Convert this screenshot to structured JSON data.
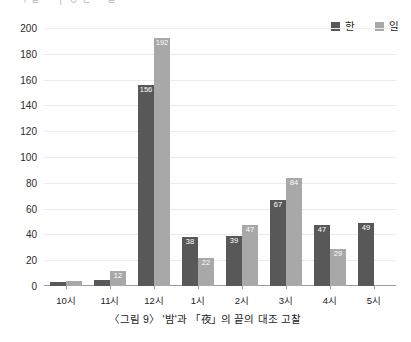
{
  "top_cropped_text": "ㄱ  ㄹ ㅡ ㅣ  ㅇ  ㄴ  ㅡ  ㄹ",
  "legend": {
    "position": "top-right",
    "entries": [
      {
        "label": "한",
        "color": "#585858",
        "icon": "legend-swatch"
      },
      {
        "label": "일",
        "color": "#a8a8a8",
        "icon": "legend-swatch"
      }
    ]
  },
  "caption": "〈그림 9〉 '밤'과 「夜」의 끝의 대조 고찰",
  "chart_data": {
    "type": "bar",
    "title": "",
    "subtitle": "",
    "xlabel": "",
    "ylabel": "",
    "categories": [
      "10시",
      "11시",
      "12시",
      "1시",
      "2시",
      "3시",
      "4시",
      "5시"
    ],
    "series": [
      {
        "name": "한",
        "color": "#585858",
        "values": [
          3,
          5,
          156,
          38,
          39,
          67,
          47,
          49
        ],
        "labels": [
          "",
          "",
          "156",
          "38",
          "39",
          "67",
          "47",
          "49"
        ]
      },
      {
        "name": "일",
        "color": "#a8a8a8",
        "values": [
          4,
          12,
          192,
          22,
          47,
          84,
          29,
          0
        ],
        "labels": [
          "",
          "12",
          "192",
          "22",
          "47",
          "84",
          "29",
          ""
        ]
      }
    ],
    "ylim": [
      0,
      200
    ],
    "yticks": [
      0,
      20,
      40,
      60,
      80,
      100,
      120,
      140,
      160,
      180,
      200
    ],
    "ytick_labels": [
      "0",
      "20",
      "40",
      "60",
      "80",
      "100",
      "120",
      "140",
      "160",
      "180",
      "200"
    ],
    "grid": true,
    "legend_position": "top-right"
  }
}
